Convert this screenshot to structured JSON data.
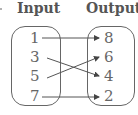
{
  "diagram": {
    "type": "mapping-diagram",
    "input_label": "Input",
    "output_label": "Output",
    "inputs": [
      "1",
      "3",
      "5",
      "7"
    ],
    "outputs": [
      "8",
      "6",
      "4",
      "2"
    ],
    "mappings": [
      {
        "from": "1",
        "to": "8"
      },
      {
        "from": "3",
        "to": "4"
      },
      {
        "from": "5",
        "to": "6"
      },
      {
        "from": "7",
        "to": "2"
      }
    ]
  }
}
